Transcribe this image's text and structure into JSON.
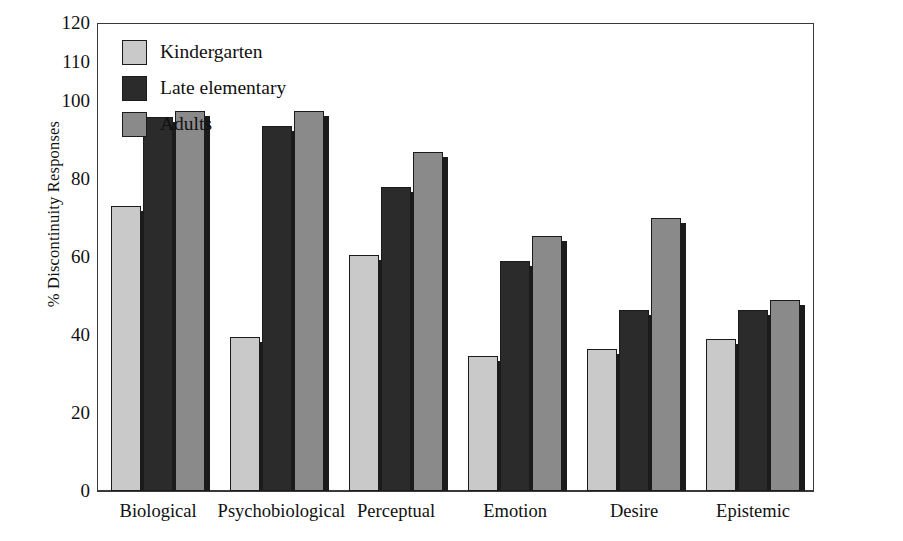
{
  "chart_data": {
    "type": "bar",
    "title": "",
    "xlabel": "",
    "ylabel": "% Discontinuity Responses",
    "ylim": [
      0,
      120
    ],
    "yticks": [
      0,
      20,
      40,
      60,
      80,
      100,
      110,
      120
    ],
    "ytick_labels": [
      "0",
      "20",
      "40",
      "60",
      "80",
      "100",
      "110",
      "120"
    ],
    "grid": false,
    "legend_position": "top-left",
    "categories": [
      "Biological",
      "Psychobiological",
      "Perceptual",
      "Emotion",
      "Desire",
      "Epistemic"
    ],
    "series": [
      {
        "name": "Kindergarten",
        "color": "#c9c9c9",
        "values": [
          73,
          39.5,
          60.5,
          34.5,
          36.5,
          39
        ]
      },
      {
        "name": "Late elementary",
        "color": "#2b2b2b",
        "values": [
          96,
          93.5,
          78,
          59,
          46.5,
          46.5
        ]
      },
      {
        "name": "Adults",
        "color": "#8a8a8a",
        "values": [
          97.5,
          97.5,
          87,
          65.5,
          70,
          49
        ]
      }
    ]
  },
  "legend": {
    "items": [
      {
        "label": "Kindergarten",
        "color": "#c9c9c9"
      },
      {
        "label": "Late elementary",
        "color": "#2b2b2b"
      },
      {
        "label": "Adults",
        "color": "#8a8a8a"
      }
    ]
  },
  "axis": {
    "y_title": "% Discontinuity Responses"
  },
  "colors": {
    "background": "#ffffff",
    "axis": "#3a3a3a",
    "text": "#111111",
    "bar_outline": "#1b1b1b",
    "shadow": "#1b1b1b"
  }
}
